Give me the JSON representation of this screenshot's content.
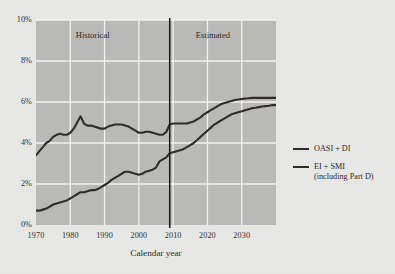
{
  "figure": {
    "background_color": "#e8e8e6",
    "plot_background_color": "#b9b9b7",
    "gridline_color": "#f2f2f0",
    "line_color": "#2f2d2b",
    "divider_color": "#1a1a19"
  },
  "annotations": {
    "historical_label": "Historical",
    "estimated_label": "Estimated"
  },
  "legend": {
    "items": [
      {
        "label": "OASI + DI",
        "label2": "",
        "color": "#2f2d2b"
      },
      {
        "label": "EI + SMI",
        "label2": "(including Part D)",
        "color": "#2f2d2b"
      }
    ]
  },
  "chart_data": {
    "type": "line",
    "title": "",
    "subtitle": "",
    "xlabel": "Calendar year",
    "ylabel": "",
    "xlim": [
      1970,
      2040
    ],
    "ylim": [
      0,
      10
    ],
    "grid": true,
    "legend_position": "right",
    "xticks": [
      1970,
      1980,
      1990,
      2000,
      2010,
      2020,
      2030
    ],
    "xtick_labels": [
      "1970",
      "1980",
      "1990",
      "2000",
      "2010",
      "2020",
      "2030"
    ],
    "yticks": [
      0,
      2,
      4,
      6,
      8,
      10
    ],
    "ytick_labels": [
      "0%",
      "2%",
      "4%",
      "6%",
      "8%",
      "10%"
    ],
    "divider_x": 2009,
    "annotations": [
      {
        "text": "Historical",
        "x": 1988,
        "y": 9.2
      },
      {
        "text": "Estimated",
        "x": 2023,
        "y": 9.2
      }
    ],
    "series": [
      {
        "name": "OASI + DI",
        "color": "#2f2d2b",
        "x": [
          1970,
          1971,
          1972,
          1973,
          1974,
          1975,
          1976,
          1977,
          1978,
          1979,
          1980,
          1981,
          1982,
          1983,
          1984,
          1985,
          1986,
          1987,
          1988,
          1989,
          1990,
          1991,
          1992,
          1993,
          1994,
          1995,
          1996,
          1997,
          1998,
          1999,
          2000,
          2001,
          2002,
          2003,
          2004,
          2005,
          2006,
          2007,
          2008,
          2009,
          2010,
          2011,
          2012,
          2013,
          2014,
          2015,
          2016,
          2017,
          2018,
          2019,
          2020,
          2021,
          2022,
          2023,
          2024,
          2025,
          2026,
          2027,
          2028,
          2029,
          2030,
          2031,
          2032,
          2033,
          2034,
          2035,
          2036,
          2037,
          2038,
          2039,
          2040
        ],
        "y": [
          3.4,
          3.6,
          3.8,
          4.0,
          4.1,
          4.3,
          4.4,
          4.45,
          4.4,
          4.4,
          4.5,
          4.7,
          5.0,
          5.3,
          4.95,
          4.85,
          4.85,
          4.8,
          4.75,
          4.7,
          4.7,
          4.8,
          4.85,
          4.9,
          4.9,
          4.9,
          4.85,
          4.8,
          4.7,
          4.6,
          4.5,
          4.5,
          4.55,
          4.55,
          4.5,
          4.45,
          4.4,
          4.4,
          4.55,
          4.9,
          4.95,
          4.95,
          4.95,
          4.95,
          4.95,
          5.0,
          5.05,
          5.15,
          5.25,
          5.4,
          5.5,
          5.6,
          5.7,
          5.8,
          5.9,
          5.95,
          6.0,
          6.05,
          6.1,
          6.12,
          6.15,
          6.17,
          6.18,
          6.2,
          6.2,
          6.2,
          6.2,
          6.2,
          6.2,
          6.2,
          6.2
        ]
      },
      {
        "name": "EI + SMI (including Part D)",
        "color": "#2f2d2b",
        "x": [
          1970,
          1971,
          1972,
          1973,
          1974,
          1975,
          1976,
          1977,
          1978,
          1979,
          1980,
          1981,
          1982,
          1983,
          1984,
          1985,
          1986,
          1987,
          1988,
          1989,
          1990,
          1991,
          1992,
          1993,
          1994,
          1995,
          1996,
          1997,
          1998,
          1999,
          2000,
          2001,
          2002,
          2003,
          2004,
          2005,
          2006,
          2007,
          2008,
          2009,
          2010,
          2011,
          2012,
          2013,
          2014,
          2015,
          2016,
          2017,
          2018,
          2019,
          2020,
          2021,
          2022,
          2023,
          2024,
          2025,
          2026,
          2027,
          2028,
          2029,
          2030,
          2031,
          2032,
          2033,
          2034,
          2035,
          2036,
          2037,
          2038,
          2039,
          2040
        ],
        "y": [
          0.7,
          0.7,
          0.75,
          0.8,
          0.9,
          1.0,
          1.05,
          1.1,
          1.15,
          1.2,
          1.3,
          1.4,
          1.5,
          1.6,
          1.6,
          1.65,
          1.7,
          1.7,
          1.75,
          1.85,
          1.95,
          2.05,
          2.2,
          2.3,
          2.4,
          2.5,
          2.6,
          2.6,
          2.55,
          2.5,
          2.45,
          2.5,
          2.6,
          2.65,
          2.7,
          2.8,
          3.1,
          3.2,
          3.3,
          3.5,
          3.55,
          3.6,
          3.65,
          3.7,
          3.8,
          3.9,
          4.0,
          4.15,
          4.3,
          4.45,
          4.6,
          4.75,
          4.9,
          5.0,
          5.1,
          5.2,
          5.3,
          5.4,
          5.45,
          5.5,
          5.55,
          5.6,
          5.65,
          5.7,
          5.72,
          5.75,
          5.78,
          5.8,
          5.82,
          5.85,
          5.85
        ]
      }
    ]
  }
}
